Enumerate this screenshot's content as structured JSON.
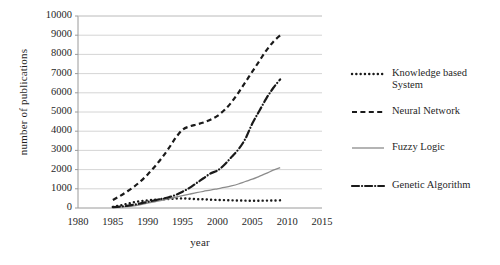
{
  "chart_data": {
    "type": "line",
    "title": "",
    "xlabel": "year",
    "ylabel": "number  of publications",
    "xlim": [
      1980,
      2015
    ],
    "ylim": [
      0,
      10000
    ],
    "xticks": [
      "1980",
      "1985",
      "1990",
      "1995",
      "2000",
      "2005",
      "2010",
      "2015"
    ],
    "yticks": [
      "0",
      "1000",
      "2000",
      "3000",
      "4000",
      "5000",
      "6000",
      "7000",
      "8000",
      "9000",
      "10000"
    ],
    "grid": "horizontal",
    "legend_position": "right",
    "x": [
      1985,
      1986,
      1987,
      1988,
      1989,
      1990,
      1991,
      1992,
      1993,
      1994,
      1995,
      1996,
      1997,
      1998,
      1999,
      2000,
      2001,
      2002,
      2003,
      2004,
      2005,
      2006,
      2007,
      2008,
      2009
    ],
    "series": [
      {
        "name": "Knowledge based System",
        "style": "dotted",
        "color": "#1a1a1a",
        "values": [
          60,
          130,
          210,
          300,
          360,
          400,
          430,
          450,
          470,
          490,
          500,
          480,
          460,
          450,
          430,
          420,
          410,
          400,
          390,
          385,
          380,
          380,
          385,
          390,
          400
        ]
      },
      {
        "name": "Neural Network",
        "style": "dashed",
        "color": "#1a1a1a",
        "values": [
          420,
          620,
          850,
          1100,
          1400,
          1750,
          2150,
          2600,
          3100,
          3650,
          4080,
          4250,
          4350,
          4450,
          4600,
          4800,
          5100,
          5500,
          6000,
          6550,
          7100,
          7650,
          8200,
          8650,
          9000
        ]
      },
      {
        "name": "Fuzzy Logic",
        "style": "solid",
        "color": "#8c8c8c",
        "values": [
          30,
          50,
          70,
          110,
          180,
          250,
          320,
          400,
          480,
          560,
          640,
          720,
          800,
          870,
          930,
          1000,
          1070,
          1150,
          1250,
          1380,
          1500,
          1650,
          1800,
          1970,
          2100
        ]
      },
      {
        "name": "Genetic Algorithm",
        "style": "dashdot",
        "color": "#1a1a1a",
        "values": [
          40,
          70,
          110,
          170,
          240,
          320,
          400,
          480,
          560,
          680,
          850,
          1050,
          1300,
          1550,
          1800,
          1950,
          2250,
          2650,
          3050,
          3600,
          4400,
          5050,
          5700,
          6250,
          6700
        ]
      }
    ]
  },
  "legend": {
    "items": [
      {
        "label": "Knowledge based\nSystem",
        "marker": "dotted-line-swatch"
      },
      {
        "label": "Neural Network",
        "marker": "dashed-line-swatch"
      },
      {
        "label": "Fuzzy Logic",
        "marker": "solid-line-swatch"
      },
      {
        "label": "Genetic Algorithm",
        "marker": "dashdot-line-swatch"
      }
    ]
  }
}
